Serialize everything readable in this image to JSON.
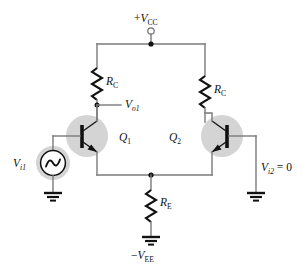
{
  "figure": {
    "name": "differential-amplifier-circuit",
    "background_color": "#ffffff",
    "wire_color": "#7a7a7a",
    "device_color": "#111111",
    "halo_color": "#d4d4d4"
  },
  "labels": {
    "supply_positive": {
      "sign": "+",
      "symbol": "V",
      "subscript": "CC"
    },
    "supply_negative": {
      "sign": "−",
      "symbol": "V",
      "subscript": "EE"
    },
    "resistor_collector_left": {
      "symbol": "R",
      "subscript": "C"
    },
    "resistor_collector_right": {
      "symbol": "R",
      "subscript": "C"
    },
    "resistor_emitter": {
      "symbol": "R",
      "subscript": "E"
    },
    "transistor_left": {
      "symbol": "Q",
      "subscript": "1"
    },
    "transistor_right": {
      "symbol": "Q",
      "subscript": "2"
    },
    "output_left": {
      "symbol": "V",
      "subscript": "o1"
    },
    "input_left": {
      "symbol": "V",
      "subscript": "i1"
    },
    "input_right": {
      "symbol": "V",
      "subscript": "i2",
      "value": " = 0"
    }
  },
  "components": [
    {
      "id": "vcc-terminal",
      "type": "terminal",
      "label": "+VCC"
    },
    {
      "id": "rc-left",
      "type": "resistor",
      "label": "RC"
    },
    {
      "id": "rc-right",
      "type": "resistor",
      "label": "RC"
    },
    {
      "id": "q1",
      "type": "npn-transistor",
      "label": "Q1"
    },
    {
      "id": "q2",
      "type": "npn-transistor",
      "label": "Q2"
    },
    {
      "id": "re",
      "type": "resistor",
      "label": "RE"
    },
    {
      "id": "vi1-source",
      "type": "ac-source",
      "label": "Vi1"
    },
    {
      "id": "vi2-ground",
      "type": "ground",
      "label": "Vi2 = 0"
    },
    {
      "id": "vee-ground",
      "type": "ground",
      "label": "-VEE"
    },
    {
      "id": "vo1-node",
      "type": "output-node",
      "label": "Vo1"
    }
  ]
}
